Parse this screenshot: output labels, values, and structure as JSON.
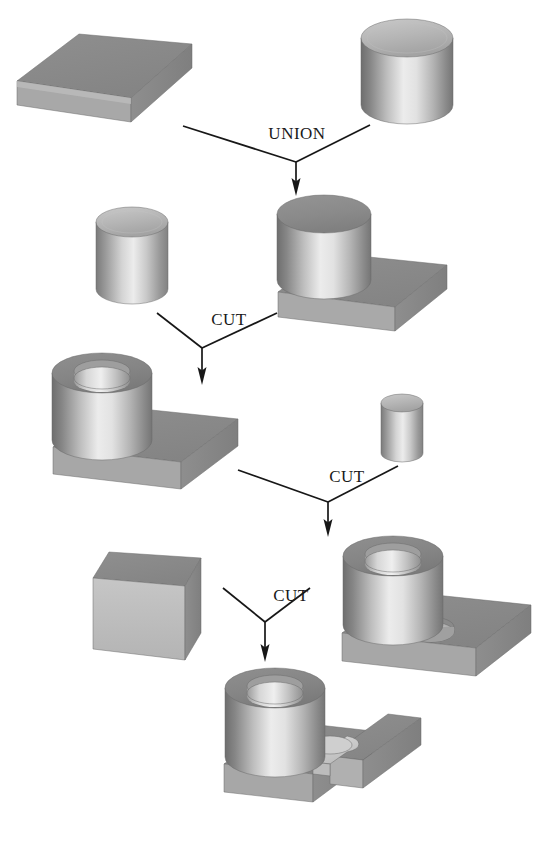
{
  "figure": {
    "width": 557,
    "height": 843,
    "background": "#ffffff"
  },
  "palette": {
    "top_dark": "#8d8d8d",
    "top_mid": "#9a9a9a",
    "front_light": "#d8d8d8",
    "front_mid": "#b6b6b6",
    "side_dark": "#7c7c7c",
    "highlight": "#f2f2f2",
    "shadow": "#6e6e6e",
    "line": "#171717",
    "text": "#1a1a1a"
  },
  "operations": [
    {
      "id": "op-union-1",
      "label": "UNION",
      "x": 297,
      "y": 139,
      "apex_x": 296,
      "apex_y": 162,
      "left_x": 183,
      "left_y": 126,
      "right_x": 370,
      "right_y": 125,
      "tip_y": 196
    },
    {
      "id": "op-cut-1",
      "label": "CUT",
      "x": 229,
      "y": 325,
      "apex_x": 202,
      "apex_y": 348,
      "left_x": 157,
      "left_y": 313,
      "right_x": 277,
      "right_y": 313,
      "tip_y": 385
    },
    {
      "id": "op-cut-2",
      "label": "CUT",
      "x": 347,
      "y": 482,
      "apex_x": 328,
      "apex_y": 502,
      "left_x": 238,
      "left_y": 470,
      "right_x": 398,
      "right_y": 466,
      "tip_y": 537
    },
    {
      "id": "op-cut-3",
      "label": "CUT",
      "x": 291,
      "y": 601,
      "apex_x": 265,
      "apex_y": 622,
      "left_x": 223,
      "left_y": 588,
      "right_x": 310,
      "right_y": 588,
      "tip_y": 662
    }
  ],
  "shapes": [
    {
      "id": "block-1",
      "name": "rectangular-block",
      "type": "box",
      "row": 1,
      "role": "operand",
      "description": "Flat rectangular slab, left operand of UNION"
    },
    {
      "id": "cylinder-1",
      "name": "large-cylinder",
      "type": "cylinder",
      "row": 1,
      "role": "operand",
      "description": "Upright solid cylinder, right operand of UNION"
    },
    {
      "id": "cylinder-2",
      "name": "cutting-cylinder-large",
      "type": "cylinder",
      "row": 2,
      "role": "operand",
      "description": "Solid cylinder used as cutting tool for first CUT"
    },
    {
      "id": "union-result",
      "name": "block-with-boss",
      "type": "union",
      "row": 2,
      "role": "result",
      "description": "Result of UNION: slab with cylindrical boss at one end"
    },
    {
      "id": "cut-result-1",
      "name": "block-with-bored-boss",
      "type": "cut",
      "row": 3,
      "role": "result",
      "description": "Result of CUT: boss bored through producing a thick ring"
    },
    {
      "id": "cylinder-3",
      "name": "cutting-cylinder-small",
      "type": "cylinder",
      "row": 3,
      "role": "operand",
      "description": "Small solid cylinder used as cutting tool for second CUT"
    },
    {
      "id": "block-2",
      "name": "cutting-block",
      "type": "box",
      "row": 4,
      "role": "operand",
      "description": "Upright rectangular block used as cutting tool for third CUT"
    },
    {
      "id": "cut-result-2",
      "name": "block-with-two-holes",
      "type": "cut",
      "row": 4,
      "role": "result",
      "description": "Result of CUT: bored boss plus small hole through the base plate"
    },
    {
      "id": "cut-result-3",
      "name": "final-part",
      "type": "cut",
      "row": 5,
      "role": "result",
      "description": "Final part: bored boss with slotted base plate"
    }
  ]
}
